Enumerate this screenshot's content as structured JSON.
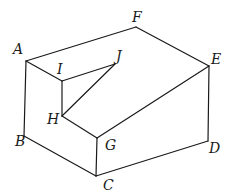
{
  "figure": {
    "type": "3d-solid-line-drawing",
    "vertices": {
      "A": {
        "label": "A",
        "x": 26,
        "y": 61,
        "lx": 13,
        "ly": 54
      },
      "B": {
        "label": "B",
        "x": 24,
        "y": 136,
        "lx": 15,
        "ly": 146
      },
      "C": {
        "label": "C",
        "x": 96,
        "y": 176,
        "lx": 103,
        "ly": 190
      },
      "D": {
        "label": "D",
        "x": 208,
        "y": 141,
        "lx": 209,
        "ly": 153
      },
      "E": {
        "label": "E",
        "x": 209,
        "y": 66,
        "lx": 211,
        "ly": 64
      },
      "F": {
        "label": "F",
        "x": 136,
        "y": 27,
        "lx": 132,
        "ly": 22
      },
      "G": {
        "label": "G",
        "x": 97,
        "y": 138,
        "lx": 105,
        "ly": 150
      },
      "H": {
        "label": "H",
        "x": 62,
        "y": 116,
        "lx": 47,
        "ly": 124
      },
      "I": {
        "label": "I",
        "x": 62,
        "y": 81,
        "lx": 57,
        "ly": 74
      },
      "J": {
        "label": "J",
        "x": 115,
        "y": 64,
        "lx": 116,
        "ly": 61
      }
    },
    "edges": [
      [
        "A",
        "F"
      ],
      [
        "F",
        "E"
      ],
      [
        "E",
        "D"
      ],
      [
        "D",
        "C"
      ],
      [
        "C",
        "B"
      ],
      [
        "B",
        "A"
      ],
      [
        "A",
        "I"
      ],
      [
        "I",
        "J"
      ],
      [
        "I",
        "H"
      ],
      [
        "H",
        "J"
      ],
      [
        "H",
        "G"
      ],
      [
        "G",
        "E"
      ],
      [
        "G",
        "C"
      ]
    ],
    "labels": [
      "A",
      "B",
      "C",
      "D",
      "E",
      "F",
      "G",
      "H",
      "I",
      "J"
    ]
  }
}
